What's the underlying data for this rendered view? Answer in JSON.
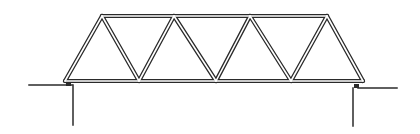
{
  "figure": {
    "style": "double-line sketch",
    "colors": {
      "line": "#2a2a2a",
      "background": "#ffffff"
    },
    "truss": {
      "top_chord": {
        "x1": 102,
        "x2": 327,
        "y": 16
      },
      "bottom_chord": {
        "x1": 65,
        "x2": 363,
        "y": 81
      },
      "top_nodes_x": [
        102,
        174,
        250,
        327
      ],
      "bottom_nodes_x": [
        65,
        139,
        216,
        291,
        363
      ],
      "panels": 4
    },
    "supports": {
      "left": {
        "ground_x1": 29,
        "ground_x2": 72,
        "ground_y": 85,
        "wall_x": 73,
        "wall_y2": 125
      },
      "right": {
        "ground_x1": 358,
        "ground_x2": 397,
        "ground_y": 88,
        "wall_x": 353,
        "wall_y2": 126
      }
    }
  }
}
